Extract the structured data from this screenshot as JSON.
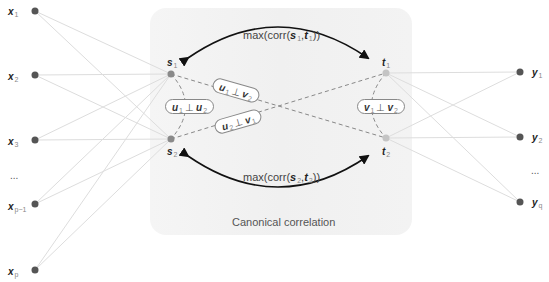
{
  "left_nodes": [
    {
      "var": "x",
      "sub": "1"
    },
    {
      "var": "x",
      "sub": "2"
    },
    {
      "var": "x",
      "sub": "3"
    },
    {
      "var": "x",
      "sub": "p−1"
    },
    {
      "var": "x",
      "sub": "p"
    }
  ],
  "left_ellipsis": "...",
  "right_nodes": [
    {
      "var": "y",
      "sub": "1"
    },
    {
      "var": "y",
      "sub": "2"
    },
    {
      "var": "y",
      "sub": "q"
    }
  ],
  "right_ellipsis": "...",
  "canonical_nodes": {
    "s1": {
      "var": "s",
      "sub": "1"
    },
    "s2": {
      "var": "s",
      "sub": "2"
    },
    "t1": {
      "var": "t",
      "sub": "1"
    },
    "t2": {
      "var": "t",
      "sub": "2"
    }
  },
  "formulas": {
    "top": {
      "prefix": "max(corr(",
      "a": "s",
      "a_sub": "1",
      "sep": ",",
      "b": "t",
      "b_sub": "1",
      "suffix": "))"
    },
    "bottom": {
      "prefix": "max(corr(",
      "a": "s",
      "a_sub": "2",
      "sep": ",",
      "b": "t",
      "b_sub": "2",
      "suffix": "))"
    }
  },
  "constraints": {
    "u1_u2": {
      "a": "u",
      "a_sub": "1",
      "perp": "⊥",
      "b": "u",
      "b_sub": "2"
    },
    "u1_v2": {
      "a": "u",
      "a_sub": "1",
      "perp": "⊥",
      "b": "v",
      "b_sub": "2"
    },
    "u2_v1": {
      "a": "u",
      "a_sub": "2",
      "perp": "⊥",
      "b": "v",
      "b_sub": "1"
    },
    "v1_v2": {
      "a": "v",
      "a_sub": "1",
      "perp": "⊥",
      "b": "v",
      "b_sub": "2"
    }
  },
  "panel_caption": "Canonical correlation",
  "colors": {
    "panel_bg": "#f1f1f1",
    "node_dark": "#555555",
    "node_s": "#8a8a8a",
    "node_t": "#bdbdbd",
    "edge": "#dddddd",
    "arrow": "#111111",
    "dashed": "#888888"
  }
}
